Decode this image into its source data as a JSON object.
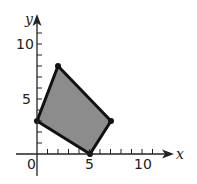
{
  "diagram": {
    "type": "coordinate-plane-polygon",
    "axes": {
      "x_label": "x",
      "y_label": "y",
      "x_ticks": [
        "0",
        "5",
        "10"
      ],
      "y_ticks": [
        "5",
        "10"
      ],
      "x_range": [
        0,
        12
      ],
      "y_range": [
        0,
        12
      ]
    },
    "polygon": {
      "vertices": [
        [
          0,
          3
        ],
        [
          2,
          8
        ],
        [
          7,
          3
        ],
        [
          5,
          0
        ]
      ],
      "fill": "#8c8c8c",
      "stroke": "#111111"
    }
  }
}
